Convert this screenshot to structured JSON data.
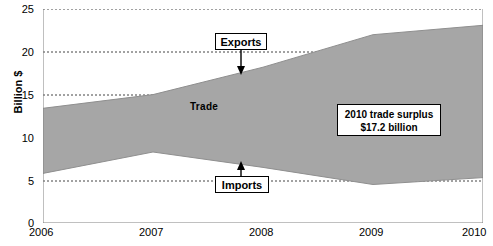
{
  "chart_data": {
    "type": "area",
    "title": "",
    "subtitle": "",
    "xlabel": "",
    "ylabel": "Billion $",
    "xlim": [
      2006,
      2010
    ],
    "ylim": [
      0,
      25
    ],
    "grid": true,
    "legend_position": "none",
    "x": [
      2006,
      2007,
      2008,
      2009,
      2010
    ],
    "x_tick_labels": [
      "2006",
      "2007",
      "2008",
      "2009",
      "2010"
    ],
    "y_tick_labels": [
      "0",
      "5",
      "10",
      "15",
      "20",
      "25"
    ],
    "y_ticks": [
      0,
      5,
      10,
      15,
      20,
      25
    ],
    "series": [
      {
        "name": "Exports",
        "values": [
          13.4,
          15.0,
          18.2,
          22.0,
          23.1
        ]
      },
      {
        "name": "Imports",
        "values": [
          5.8,
          8.3,
          6.5,
          4.5,
          5.3
        ]
      }
    ],
    "band_label": "Trade",
    "band_color": "#a6a6a6",
    "annotations": [
      {
        "name": "exports-callout",
        "text": "Exports",
        "points_to": "Exports series"
      },
      {
        "name": "imports-callout",
        "text": "Imports",
        "points_to": "Imports series"
      },
      {
        "name": "surplus-callout",
        "line1": "2010 trade surplus",
        "line2": "$17.2 billion"
      }
    ]
  },
  "axes": {
    "y_title": "Billion $",
    "y_labels": [
      "25",
      "20",
      "15",
      "10",
      "5",
      "0"
    ],
    "x_labels": [
      "2006",
      "2007",
      "2008",
      "2009",
      "2010"
    ]
  },
  "labels": {
    "trade": "Trade",
    "exports": "Exports",
    "imports": "Imports",
    "surplus_line1": "2010 trade surplus",
    "surplus_line2": "$17.2 billion"
  },
  "colors": {
    "band": "#a6a6a6",
    "axis": "#808080",
    "grid": "#555555",
    "text": "#000000",
    "background": "#ffffff"
  }
}
